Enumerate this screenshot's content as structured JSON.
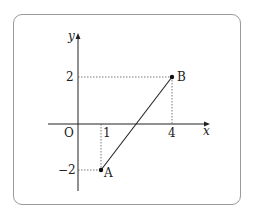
{
  "diagram": {
    "type": "coordinate-plane",
    "axes": {
      "x_label": "x",
      "y_label": "y",
      "origin_label": "O",
      "x_ticks": [
        {
          "value": 1,
          "label": "1"
        },
        {
          "value": 4,
          "label": "4"
        }
      ],
      "y_ticks": [
        {
          "value": 2,
          "label": "2"
        },
        {
          "value": -2,
          "label": "−2"
        }
      ]
    },
    "points": [
      {
        "name": "A",
        "label": "A",
        "x": 1,
        "y": -2
      },
      {
        "name": "B",
        "label": "B",
        "x": 4,
        "y": 2
      }
    ],
    "segments": [
      {
        "from": "A",
        "to": "B"
      }
    ],
    "guide_lines": "dotted projections from A and B to both axes",
    "colors": {
      "axis": "#222222",
      "segment": "#222222",
      "guide": "#555555",
      "frame": "#9a9a9a"
    }
  }
}
